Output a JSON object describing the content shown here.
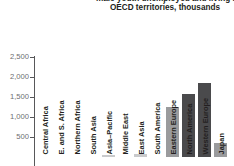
{
  "chart_data": {
    "type": "bar",
    "title": "male youth unemployed and living in OECD territories, thousands",
    "title_lines": [
      "male youth unemployed and living in",
      "OECD territories, thousands"
    ],
    "xlabel": "",
    "ylabel": "",
    "ylim": [
      0,
      2500
    ],
    "grid": false,
    "legend": "none",
    "yticks": [
      "500",
      "1,000",
      "1,500",
      "2,000",
      "2,500"
    ],
    "ytick_values": [
      500,
      1000,
      1500,
      2000,
      2500
    ],
    "categories": [
      "Central Africa",
      "E. and S. Africa",
      "Northern Africa",
      "South Asia",
      "Asia–Pacific",
      "Middle East",
      "East Asia",
      "South America",
      "Eastern Europe",
      "North America",
      "Western Europe",
      "Japan"
    ],
    "values": [
      0,
      0,
      0,
      0,
      60,
      0,
      70,
      0,
      1250,
      1575,
      1850,
      350
    ],
    "colors": {
      "light": "#9a9b9d",
      "dark": "#4a4a4c",
      "faint": "#c9cacc",
      "axis": "#58585a",
      "tick_label": "#6d6e70",
      "text": "#231f20"
    },
    "bar_styles": [
      "faint",
      "faint",
      "faint",
      "faint",
      "faint",
      "faint",
      "faint",
      "faint",
      "light",
      "dark",
      "dark",
      "light"
    ]
  }
}
